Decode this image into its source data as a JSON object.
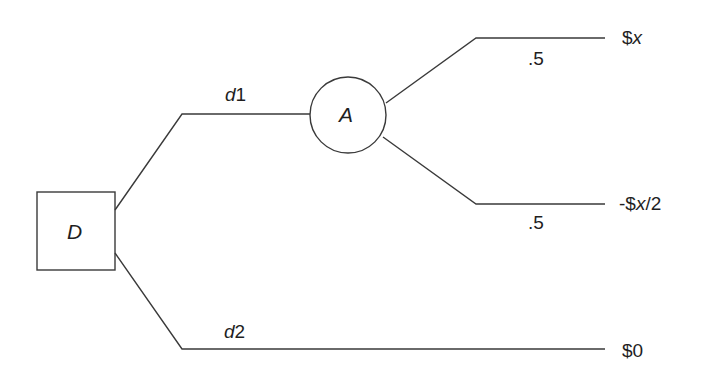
{
  "diagram": {
    "type": "decision-tree",
    "nodes": {
      "decision": {
        "shape": "square",
        "label": "D"
      },
      "chance": {
        "shape": "circle",
        "label": "A"
      }
    },
    "branches": [
      {
        "id": "d1",
        "label": "d1",
        "from": "D",
        "to": "A"
      },
      {
        "id": "d2",
        "label": "d2",
        "from": "D",
        "to": "outcome-zero"
      },
      {
        "id": "a-up",
        "label": ".5",
        "from": "A",
        "to": "outcome-x"
      },
      {
        "id": "a-down",
        "label": ".5",
        "from": "A",
        "to": "outcome-neg-half-x"
      }
    ],
    "outcomes": {
      "x": {
        "prefix": "$",
        "var": "x",
        "suffix": ""
      },
      "neg_half_x": {
        "prefix": "-$",
        "var": "x",
        "suffix": "/2"
      },
      "zero": {
        "text": "$0"
      }
    },
    "probabilities": {
      "up": ".5",
      "down": ".5"
    },
    "decisions": {
      "d1_letter": "d",
      "d1_num": "1",
      "d2_letter": "d",
      "d2_num": "2"
    },
    "colors": {
      "stroke": "#3a3a3a",
      "text": "#1f1f1f",
      "background": "#ffffff"
    }
  }
}
